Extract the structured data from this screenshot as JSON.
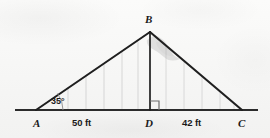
{
  "figure": {
    "kind": "geometry-diagram",
    "background_color": "#f6f6f5",
    "ink_color": "#1a1a1a",
    "hatch_color": "#cfcfcf"
  },
  "vertices": {
    "A": "A",
    "B": "B",
    "C": "C",
    "D": "D"
  },
  "measures": {
    "angle_at_A": "35°",
    "segment_AD": "50 ft",
    "segment_DC": "42 ft"
  },
  "markers": {
    "right_angle_at_D": "right-angle-marker"
  },
  "geometry": {
    "A": [
      36,
      110
    ],
    "B": [
      150,
      32
    ],
    "C": [
      242,
      110
    ],
    "D": [
      150,
      110
    ],
    "baseline_start": [
      15,
      110
    ],
    "baseline_end": [
      258,
      110
    ],
    "hatch_x": [
      68,
      86,
      104,
      122,
      140,
      168,
      186,
      204,
      222
    ],
    "right_angle_size": 9
  }
}
